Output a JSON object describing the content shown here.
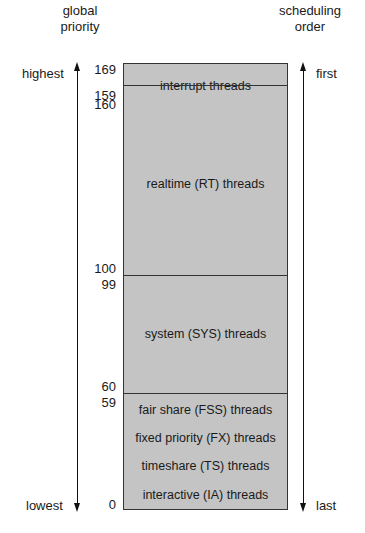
{
  "header": {
    "left_label": [
      "global",
      "priority"
    ],
    "right_label": [
      "scheduling",
      "order"
    ]
  },
  "axis": {
    "top_left": "highest",
    "bottom_left": "lowest",
    "top_right": "first",
    "bottom_right": "last"
  },
  "ticks": {
    "t169": "169",
    "t160": "160",
    "t159": "159",
    "t100": "100",
    "t99": "99",
    "t60": "60",
    "t59": "59",
    "t0": "0"
  },
  "classes": {
    "interrupt": "interrupt threads",
    "rt": "realtime (RT) threads",
    "sys": "system (SYS) threads",
    "fss": "fair share (FSS) threads",
    "fx": "fixed priority (FX) threads",
    "ts": "timeshare (TS) threads",
    "ia": "interactive (IA) threads"
  },
  "colors": {
    "block_fill": "#c4c4c4",
    "border": "#333333"
  }
}
